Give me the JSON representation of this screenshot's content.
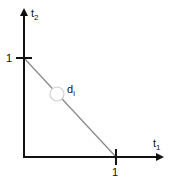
{
  "diagram": {
    "axes": {
      "x": {
        "label": "t",
        "subscript": "1",
        "tick_label": "1"
      },
      "y": {
        "label": "t",
        "subscript": "2",
        "tick_label": "1"
      }
    },
    "line": {
      "from": [
        0,
        1
      ],
      "to": [
        1,
        0
      ],
      "color": "#888888"
    },
    "point": {
      "label": "d",
      "subscript": "i",
      "position": [
        0.36,
        0.64
      ],
      "stroke": "#cccccc"
    },
    "colors": {
      "axis": "#111111",
      "line": "#888888",
      "point": "#cccccc"
    }
  }
}
